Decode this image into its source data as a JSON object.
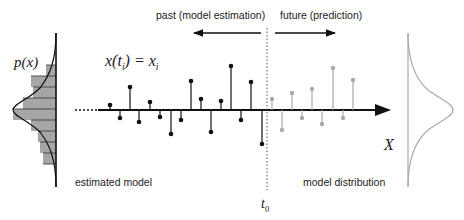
{
  "labels": {
    "past": "past (model estimation)",
    "future": "future (prediction)",
    "equation_lhs": "x(t",
    "equation_sub": "i",
    "equation_mid": ") = x",
    "equation_sub2": "i",
    "px": "p(x)",
    "axis_x": "X",
    "estimated_model": "estimated model",
    "model_distribution": "model distribution",
    "t0_base": "t",
    "t0_sub": "0"
  },
  "colors": {
    "past_stem": "#111111",
    "future_stem": "#aaaaaa",
    "histogram_fill": "#a6a6a6",
    "histogram_line": "#333333",
    "right_curve": "#aaaaaa",
    "axis": "#111111"
  },
  "diagram": {
    "axis_y": 110,
    "t0_x": 267,
    "past_stems": [
      {
        "x": 110,
        "y": 105
      },
      {
        "x": 120,
        "y": 118
      },
      {
        "x": 130,
        "y": 87
      },
      {
        "x": 139,
        "y": 122
      },
      {
        "x": 150,
        "y": 102
      },
      {
        "x": 160,
        "y": 117
      },
      {
        "x": 171,
        "y": 134
      },
      {
        "x": 181,
        "y": 120
      },
      {
        "x": 191,
        "y": 81
      },
      {
        "x": 201,
        "y": 99
      },
      {
        "x": 211,
        "y": 132
      },
      {
        "x": 221,
        "y": 101
      },
      {
        "x": 231,
        "y": 66
      },
      {
        "x": 241,
        "y": 120
      },
      {
        "x": 251,
        "y": 82
      },
      {
        "x": 262,
        "y": 144
      }
    ],
    "future_stems": [
      {
        "x": 272,
        "y": 99
      },
      {
        "x": 282,
        "y": 130
      },
      {
        "x": 292,
        "y": 93
      },
      {
        "x": 302,
        "y": 118
      },
      {
        "x": 312,
        "y": 89
      },
      {
        "x": 322,
        "y": 124
      },
      {
        "x": 333,
        "y": 68
      },
      {
        "x": 343,
        "y": 118
      },
      {
        "x": 353,
        "y": 80
      }
    ],
    "histogram_bars": [
      {
        "y": 65,
        "left": 46
      },
      {
        "y": 76,
        "left": 31
      },
      {
        "y": 87,
        "left": 33
      },
      {
        "y": 98,
        "left": 23
      },
      {
        "y": 109,
        "left": 13
      },
      {
        "y": 120,
        "left": 31
      },
      {
        "y": 131,
        "left": 38
      },
      {
        "y": 142,
        "left": 40
      },
      {
        "y": 153,
        "left": 43
      }
    ]
  }
}
